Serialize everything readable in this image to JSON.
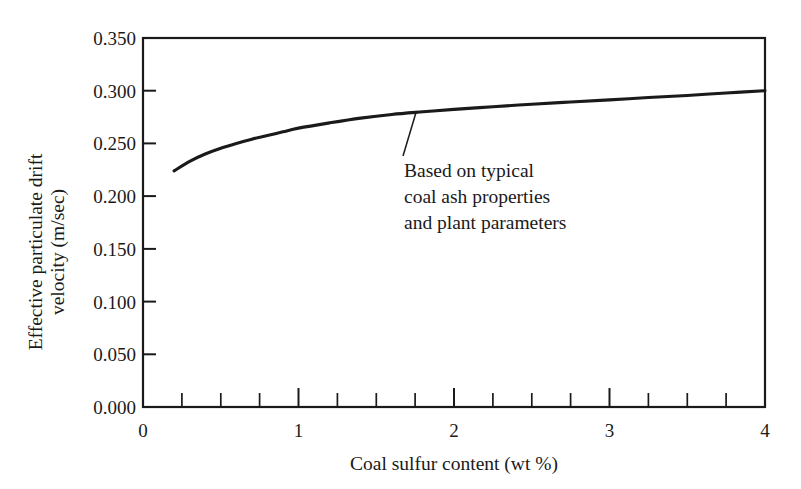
{
  "figure": {
    "background_color": "#ffffff",
    "ink_color": "#1a1a1a"
  },
  "chart_data": {
    "type": "line",
    "title": "",
    "subtitle": "",
    "xlabel": "Coal sulfur content (wt %)",
    "ylabel": "Effective particulate drift velocity (m/sec)",
    "ylabel_lines": [
      "Effective particulate drift",
      "velocity (m/sec)"
    ],
    "xlim": [
      0,
      4
    ],
    "ylim": [
      0.0,
      0.35
    ],
    "grid": false,
    "legend": null,
    "legend_position": "none",
    "x_ticks_major": [
      0,
      1,
      2,
      3,
      4
    ],
    "x_ticklabels": [
      "0",
      "1",
      "2",
      "3",
      "4"
    ],
    "x_ticks_minor": [
      0.25,
      0.5,
      0.75,
      1.25,
      1.5,
      1.75,
      2.25,
      2.5,
      2.75,
      3.25,
      3.5,
      3.75
    ],
    "y_ticks_major": [
      0.0,
      0.05,
      0.1,
      0.15,
      0.2,
      0.25,
      0.3,
      0.35
    ],
    "y_ticklabels": [
      "0.000",
      "0.050",
      "0.100",
      "0.150",
      "0.200",
      "0.250",
      "0.300",
      "0.350"
    ],
    "series": [
      {
        "name": "Effective particulate drift velocity",
        "color": "#1a1a1a",
        "x": [
          0.2,
          0.3,
          0.4,
          0.5,
          0.6,
          0.7,
          0.8,
          0.9,
          1.0,
          1.2,
          1.4,
          1.6,
          1.8,
          2.0,
          2.25,
          2.5,
          2.75,
          3.0,
          3.25,
          3.5,
          3.75,
          4.0
        ],
        "values": [
          0.224,
          0.233,
          0.24,
          0.2455,
          0.25,
          0.254,
          0.2575,
          0.261,
          0.2645,
          0.2695,
          0.274,
          0.2775,
          0.28,
          0.2823,
          0.2848,
          0.2872,
          0.2893,
          0.2913,
          0.2935,
          0.2955,
          0.2978,
          0.3
        ]
      }
    ],
    "annotations": [
      {
        "id": "curve-note",
        "lines": [
          "Based on typical",
          "coal ash properties",
          "and plant parameters"
        ],
        "text": "Based on typical coal ash properties and plant parameters",
        "point_x": 1.75,
        "point_y": 0.279,
        "text_x": 1.68,
        "text_y": 0.222
      }
    ]
  }
}
